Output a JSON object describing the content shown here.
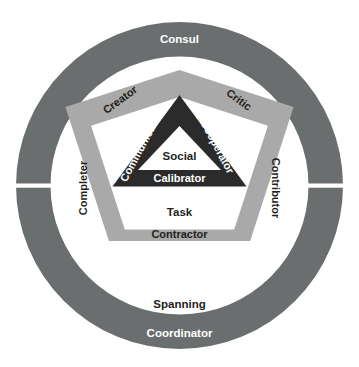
{
  "diagram": {
    "type": "concentric-rings-pentagon-triangle",
    "colors": {
      "background": "#ffffff",
      "outer_ring": "#6a6e6e",
      "pentagon_band": "#a9a9a9",
      "inner_triangle": "#2b2b2b",
      "light_text": "#ffffff",
      "dark_text": "#231f20"
    },
    "outer_ring": {
      "name": "outer-ring",
      "fill": "#6a6e6e",
      "gaps": [
        "left",
        "right"
      ],
      "labels": [
        {
          "text": "Consul",
          "position": "top",
          "on_ring": true
        },
        {
          "text": "Coordinator",
          "position": "bottom",
          "on_ring": true
        }
      ]
    },
    "ring_gap_labels": [
      {
        "text": "Spanning",
        "position": "bottom-inner-white",
        "on_ring": false
      }
    ],
    "pentagon": {
      "name": "pentagon-band",
      "fill": "#a9a9a9",
      "labels": [
        {
          "text": "Creator",
          "side": "upper-left",
          "rotation": -36
        },
        {
          "text": "Critic",
          "side": "upper-right",
          "rotation": 36
        },
        {
          "text": "Completer",
          "side": "left",
          "rotation": -90
        },
        {
          "text": "Contributor",
          "side": "right",
          "rotation": 90
        },
        {
          "text": "Contractor",
          "side": "bottom",
          "rotation": 0
        }
      ],
      "inner_label": {
        "text": "Task",
        "position": "lower-center"
      }
    },
    "triangle": {
      "name": "inner-triangle",
      "fill": "#2b2b2b",
      "labels": [
        {
          "text": "Communicator",
          "side": "left",
          "rotation": -62
        },
        {
          "text": "Cooperator",
          "side": "right",
          "rotation": 62
        },
        {
          "text": "Calibrator",
          "side": "bottom",
          "rotation": 0
        }
      ],
      "inner_label": {
        "text": "Social",
        "position": "center"
      }
    }
  },
  "labels": {
    "consul": "Consul",
    "coordinator": "Coordinator",
    "spanning": "Spanning",
    "creator": "Creator",
    "critic": "Critic",
    "completer": "Completer",
    "contributor": "Contributor",
    "contractor": "Contractor",
    "task": "Task",
    "communicator": "Communicator",
    "cooperator": "Cooperator",
    "calibrator": "Calibrator",
    "social": "Social"
  }
}
